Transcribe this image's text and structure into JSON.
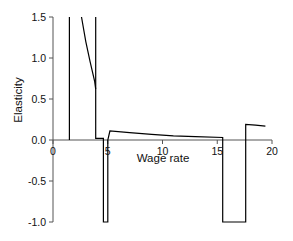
{
  "chart_data": {
    "type": "line",
    "title": "",
    "xlabel": "Wage rate",
    "ylabel": "Elasticity",
    "xlim": [
      0,
      20
    ],
    "ylim": [
      -1.0,
      1.5
    ],
    "xticks": [
      0,
      5,
      10,
      15,
      20
    ],
    "yticks": [
      -1.0,
      -0.5,
      0.0,
      0.5,
      1.0,
      1.5
    ],
    "xtick_labels": [
      "0",
      "5",
      "10",
      "15",
      "20"
    ],
    "ytick_labels": [
      "-1.0",
      "-0.5",
      "0.0",
      "0.5",
      "1.0",
      "1.5"
    ],
    "grid": false,
    "legend": null,
    "series": [
      {
        "name": "Elasticity",
        "color": "#000000",
        "points": [
          [
            1.5,
            0.0
          ],
          [
            1.5,
            1.5
          ],
          [
            2.6,
            1.5
          ],
          [
            3.0,
            1.2
          ],
          [
            3.4,
            0.95
          ],
          [
            3.8,
            0.72
          ],
          [
            3.9,
            0.62
          ],
          [
            3.9,
            1.5
          ],
          [
            3.9,
            0.02
          ],
          [
            4.6,
            0.02
          ],
          [
            4.6,
            -1.0
          ],
          [
            5.0,
            -1.0
          ],
          [
            5.0,
            0.0
          ],
          [
            5.2,
            0.11
          ],
          [
            7.0,
            0.09
          ],
          [
            9.0,
            0.07
          ],
          [
            11.0,
            0.05
          ],
          [
            13.0,
            0.04
          ],
          [
            15.5,
            0.03
          ],
          [
            15.5,
            -1.0
          ],
          [
            17.6,
            -1.0
          ],
          [
            17.6,
            0.19
          ],
          [
            18.5,
            0.18
          ],
          [
            19.4,
            0.17
          ]
        ]
      }
    ]
  }
}
